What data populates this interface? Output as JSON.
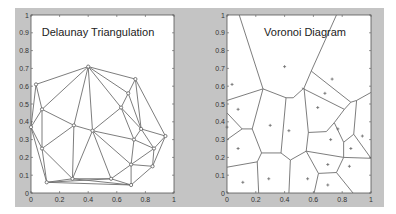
{
  "figure": {
    "background_color": "#ffffff",
    "panel_color": "#c4c4c4",
    "plot_bg": "#ffffff",
    "line_color": "#6e6e6e",
    "marker_color": "#6a6a6a"
  },
  "chart_data": [
    {
      "type": "scatter",
      "subtype": "delaunay-triangulation",
      "title": "Delaunay Triangulation",
      "xlabel": "",
      "ylabel": "",
      "xlim": [
        0,
        1
      ],
      "ylim": [
        0,
        1
      ],
      "xticks": [
        "0",
        "0.2",
        "0.4",
        "0.6",
        "0.8",
        "1"
      ],
      "yticks": [
        "0",
        "0.1",
        "0.2",
        "0.3",
        "0.4",
        "0.5",
        "0.6",
        "0.7",
        "0.8",
        "0.9",
        "1"
      ],
      "grid": false,
      "points": [
        [
          0.4,
          0.71
        ],
        [
          0.035,
          0.61
        ],
        [
          0.73,
          0.64
        ],
        [
          0.68,
          0.56
        ],
        [
          0.63,
          0.48
        ],
        [
          0.077,
          0.47
        ],
        [
          0.3,
          0.38
        ],
        [
          0.43,
          0.35
        ],
        [
          0.0,
          0.37
        ],
        [
          0.77,
          0.36
        ],
        [
          0.94,
          0.32
        ],
        [
          0.72,
          0.3
        ],
        [
          0.077,
          0.25
        ],
        [
          0.86,
          0.25
        ],
        [
          0.7,
          0.16
        ],
        [
          0.85,
          0.15
        ],
        [
          0.11,
          0.06
        ],
        [
          0.29,
          0.08
        ],
        [
          0.56,
          0.08
        ],
        [
          0.7,
          0.045
        ]
      ],
      "edges": [
        [
          0,
          1
        ],
        [
          0,
          2
        ],
        [
          0,
          3
        ],
        [
          0,
          4
        ],
        [
          0,
          7
        ],
        [
          0,
          5
        ],
        [
          0,
          6
        ],
        [
          1,
          5
        ],
        [
          1,
          8
        ],
        [
          2,
          3
        ],
        [
          2,
          9
        ],
        [
          2,
          10
        ],
        [
          3,
          4
        ],
        [
          3,
          9
        ],
        [
          4,
          7
        ],
        [
          4,
          9
        ],
        [
          4,
          11
        ],
        [
          5,
          6
        ],
        [
          5,
          8
        ],
        [
          5,
          12
        ],
        [
          6,
          7
        ],
        [
          6,
          12
        ],
        [
          6,
          17
        ],
        [
          7,
          17
        ],
        [
          7,
          18
        ],
        [
          7,
          11
        ],
        [
          7,
          14
        ],
        [
          8,
          12
        ],
        [
          8,
          16
        ],
        [
          9,
          10
        ],
        [
          9,
          11
        ],
        [
          9,
          13
        ],
        [
          10,
          13
        ],
        [
          10,
          15
        ],
        [
          11,
          13
        ],
        [
          11,
          14
        ],
        [
          12,
          16
        ],
        [
          12,
          17
        ],
        [
          13,
          14
        ],
        [
          13,
          15
        ],
        [
          14,
          15
        ],
        [
          14,
          18
        ],
        [
          14,
          19
        ],
        [
          15,
          19
        ],
        [
          16,
          17
        ],
        [
          16,
          18
        ],
        [
          16,
          19
        ],
        [
          17,
          18
        ],
        [
          17,
          19
        ],
        [
          18,
          19
        ]
      ]
    },
    {
      "type": "scatter",
      "subtype": "voronoi-diagram",
      "title": "Voronoi Diagram",
      "xlabel": "",
      "ylabel": "",
      "xlim": [
        0,
        1
      ],
      "ylim": [
        0,
        1
      ],
      "xticks": [
        "0",
        "0.2",
        "0.4",
        "0.6",
        "0.8",
        "1"
      ],
      "yticks": [
        "0",
        "0.1",
        "0.2",
        "0.3",
        "0.4",
        "0.5",
        "0.6",
        "0.7",
        "0.8",
        "0.9",
        "1"
      ],
      "grid": false,
      "sites": [
        [
          0.4,
          0.71
        ],
        [
          0.035,
          0.61
        ],
        [
          0.73,
          0.64
        ],
        [
          0.68,
          0.56
        ],
        [
          0.63,
          0.48
        ],
        [
          0.077,
          0.47
        ],
        [
          0.3,
          0.38
        ],
        [
          0.43,
          0.35
        ],
        [
          0.0,
          0.37
        ],
        [
          0.77,
          0.36
        ],
        [
          0.94,
          0.32
        ],
        [
          0.72,
          0.3
        ],
        [
          0.077,
          0.25
        ],
        [
          0.86,
          0.25
        ],
        [
          0.7,
          0.16
        ],
        [
          0.85,
          0.15
        ],
        [
          0.11,
          0.06
        ],
        [
          0.29,
          0.08
        ],
        [
          0.56,
          0.08
        ],
        [
          0.7,
          0.045
        ]
      ],
      "edges": [
        [
          [
            0.085,
            1.0
          ],
          [
            0.25,
            0.585
          ]
        ],
        [
          [
            0.76,
            1.0
          ],
          [
            0.585,
            0.685
          ]
        ],
        [
          [
            0.0,
            0.52
          ],
          [
            0.25,
            0.585
          ]
        ],
        [
          [
            0.25,
            0.585
          ],
          [
            0.41,
            0.535
          ]
        ],
        [
          [
            0.41,
            0.535
          ],
          [
            0.46,
            0.535
          ]
        ],
        [
          [
            0.46,
            0.535
          ],
          [
            0.535,
            0.59
          ]
        ],
        [
          [
            0.535,
            0.59
          ],
          [
            0.585,
            0.685
          ]
        ],
        [
          [
            0.585,
            0.685
          ],
          [
            0.86,
            0.51
          ]
        ],
        [
          [
            0.86,
            0.51
          ],
          [
            0.9,
            0.52
          ]
        ],
        [
          [
            0.9,
            0.52
          ],
          [
            1.0,
            0.565
          ]
        ],
        [
          [
            0.52,
            0.59
          ],
          [
            0.815,
            0.47
          ]
        ],
        [
          [
            0.815,
            0.47
          ],
          [
            0.86,
            0.51
          ]
        ],
        [
          [
            0.815,
            0.47
          ],
          [
            0.745,
            0.395
          ]
        ],
        [
          [
            0.9,
            0.52
          ],
          [
            0.88,
            0.33
          ]
        ],
        [
          [
            0.745,
            0.395
          ],
          [
            0.69,
            0.345
          ]
        ],
        [
          [
            0.745,
            0.395
          ],
          [
            0.81,
            0.285
          ]
        ],
        [
          [
            0.69,
            0.345
          ],
          [
            0.565,
            0.34
          ]
        ],
        [
          [
            0.535,
            0.59
          ],
          [
            0.565,
            0.34
          ]
        ],
        [
          [
            0.565,
            0.34
          ],
          [
            0.55,
            0.235
          ]
        ],
        [
          [
            0.25,
            0.585
          ],
          [
            0.175,
            0.36
          ]
        ],
        [
          [
            0.41,
            0.535
          ],
          [
            0.375,
            0.225
          ]
        ],
        [
          [
            0.0,
            0.45
          ],
          [
            0.105,
            0.36
          ]
        ],
        [
          [
            0.105,
            0.36
          ],
          [
            0.175,
            0.36
          ]
        ],
        [
          [
            0.0,
            0.3
          ],
          [
            0.105,
            0.36
          ]
        ],
        [
          [
            0.175,
            0.36
          ],
          [
            0.24,
            0.225
          ]
        ],
        [
          [
            0.24,
            0.225
          ],
          [
            0.375,
            0.225
          ]
        ],
        [
          [
            0.375,
            0.225
          ],
          [
            0.44,
            0.185
          ]
        ],
        [
          [
            0.44,
            0.185
          ],
          [
            0.55,
            0.235
          ]
        ],
        [
          [
            0.55,
            0.235
          ],
          [
            0.81,
            0.2
          ]
        ],
        [
          [
            0.81,
            0.285
          ],
          [
            0.81,
            0.2
          ]
        ],
        [
          [
            0.81,
            0.285
          ],
          [
            0.88,
            0.33
          ]
        ],
        [
          [
            0.88,
            0.33
          ],
          [
            1.0,
            0.195
          ]
        ],
        [
          [
            0.81,
            0.2
          ],
          [
            1.0,
            0.195
          ]
        ],
        [
          [
            0.0,
            0.145
          ],
          [
            0.21,
            0.175
          ]
        ],
        [
          [
            0.21,
            0.175
          ],
          [
            0.24,
            0.225
          ]
        ],
        [
          [
            0.21,
            0.175
          ],
          [
            0.22,
            0.0
          ]
        ],
        [
          [
            0.44,
            0.185
          ],
          [
            0.43,
            0.0
          ]
        ],
        [
          [
            0.55,
            0.235
          ],
          [
            0.635,
            0.11
          ]
        ],
        [
          [
            0.635,
            0.11
          ],
          [
            0.76,
            0.115
          ]
        ],
        [
          [
            0.76,
            0.115
          ],
          [
            0.81,
            0.2
          ]
        ],
        [
          [
            0.635,
            0.11
          ],
          [
            0.605,
            0.0
          ]
        ],
        [
          [
            0.76,
            0.115
          ],
          [
            0.875,
            0.0
          ]
        ]
      ]
    }
  ],
  "panels": [
    {
      "id": "delaunay",
      "title": "Delaunay Triangulation"
    },
    {
      "id": "voronoi",
      "title": "Voronoi Diagram"
    }
  ]
}
